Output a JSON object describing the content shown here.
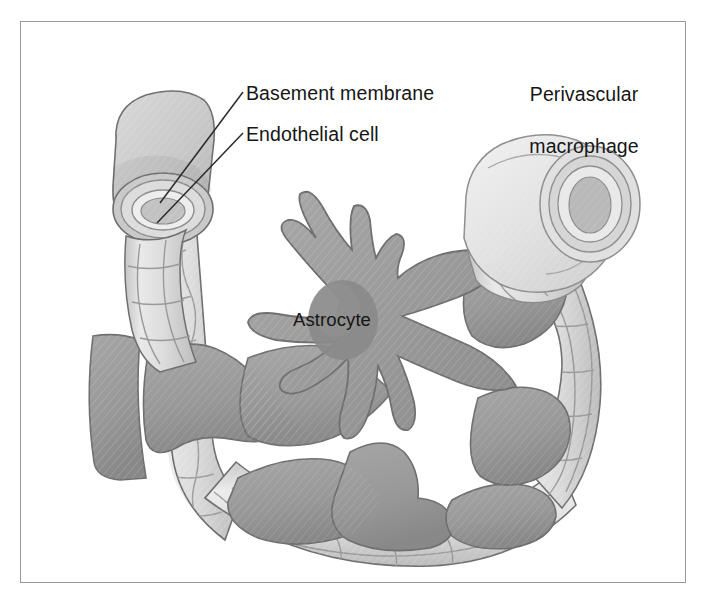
{
  "figure": {
    "type": "scientific-illustration",
    "background_color": "#ffffff",
    "border_color": "#9a9a9a",
    "text_color": "#161616"
  },
  "labels": {
    "basement_membrane": "Basement membrane",
    "endothelial_cell": "Endothelial cell",
    "perivascular_macrophage_line1": "Perivascular",
    "perivascular_macrophage_line2": "macrophage",
    "astrocyte": "Astrocyte"
  },
  "palette": {
    "astrocyte_body": "#9b9b9b",
    "astrocyte_body_dark": "#8a8a8a",
    "astrocyte_nucleus": "#8b8b8b",
    "vessel_wall": "#d8d8d8",
    "vessel_wall_light": "#e6e6e6",
    "vessel_shadow": "#b4b4b4",
    "macrophage": "#e2e2e2",
    "outline": "#6f6f6f",
    "leader_line": "#2a2a2a"
  },
  "structures": [
    {
      "name": "upper-left-vessel",
      "description": "cut capillary end with concentric basement membrane and endothelial rings"
    },
    {
      "name": "upper-right-vessel",
      "description": "cut capillary end wrapped by perivascular macrophage"
    },
    {
      "name": "left-vessel-segment",
      "description": "vertical capillary with endothelial cell mosaic"
    },
    {
      "name": "bottom-vessel-segment",
      "description": "horizontal capillary with endothelial cell mosaic"
    },
    {
      "name": "right-vessel-segment",
      "description": "curved capillary with endothelial cell mosaic"
    },
    {
      "name": "astrocyte",
      "description": "central star-shaped cell with nucleus and radiating processes"
    },
    {
      "name": "astrocyte-end-feet",
      "description": "flared plates of astrocyte contacting vessel walls"
    }
  ],
  "leader_lines": [
    {
      "name": "basement-membrane-leader",
      "from": [
        243,
        92
      ],
      "to": [
        160,
        203
      ]
    },
    {
      "name": "endothelial-cell-leader",
      "from": [
        243,
        133
      ],
      "to": [
        157,
        223
      ]
    }
  ]
}
